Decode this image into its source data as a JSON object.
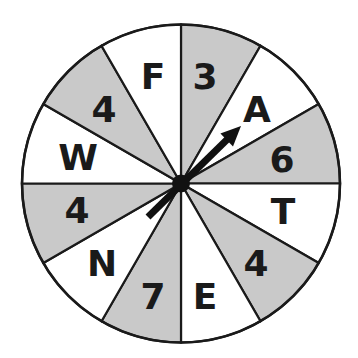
{
  "spinner": {
    "center": [
      181,
      183.5
    ],
    "radius": 159,
    "outline_color": "#1a1a1a",
    "colors": {
      "shaded": "#c9c9c9",
      "unshaded": "#ffffff"
    },
    "sectors": [
      {
        "label": "3",
        "shaded": true,
        "label_pos": [
          205,
          76
        ]
      },
      {
        "label": "A",
        "shaded": false,
        "label_pos": [
          257,
          109
        ]
      },
      {
        "label": "6",
        "shaded": true,
        "label_pos": [
          282,
          159
        ]
      },
      {
        "label": "T",
        "shaded": false,
        "label_pos": [
          283,
          211
        ]
      },
      {
        "label": "4",
        "shaded": true,
        "label_pos": [
          256,
          263
        ]
      },
      {
        "label": "E",
        "shaded": false,
        "label_pos": [
          205,
          296
        ]
      },
      {
        "label": "7",
        "shaded": true,
        "label_pos": [
          153,
          296
        ]
      },
      {
        "label": "N",
        "shaded": false,
        "label_pos": [
          102,
          263
        ]
      },
      {
        "label": "4",
        "shaded": true,
        "label_pos": [
          77,
          210
        ]
      },
      {
        "label": "W",
        "shaded": false,
        "label_pos": [
          78,
          157
        ]
      },
      {
        "label": "4",
        "shaded": true,
        "label_pos": [
          104,
          109
        ]
      },
      {
        "label": "F",
        "shaded": false,
        "label_pos": [
          153,
          76
        ]
      }
    ],
    "pointer": {
      "tip": [
        241,
        126
      ],
      "tail": [
        148,
        217
      ],
      "pointing_to": "A",
      "color": "#111111"
    }
  }
}
